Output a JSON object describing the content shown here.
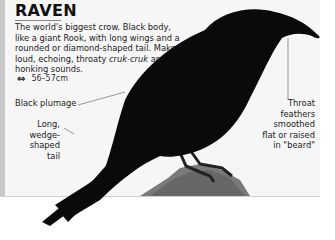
{
  "entry": {
    "title": "RAVEN",
    "description_parts": {
      "p1": "The world's biggest crow. Black body, like a giant Rook, with long wings and a rounded or diamond-shaped tail. Makes loud, echoing, throaty ",
      "call": "cruk-cruk",
      "p2": " and honking sounds."
    },
    "size": {
      "icon": "double-arrow-icon",
      "value": "56–57cm"
    }
  },
  "annotations": {
    "plumage": "Black plumage",
    "tail": "Long, wedge-shaped tail",
    "throat": "Throat feathers smoothed flat or raised in \"beard\""
  },
  "colors": {
    "panel": "#f6f6f6",
    "side_bar": "#c8c8c8",
    "bird": "#0a0a0a",
    "rock": "#7a7a7a"
  }
}
